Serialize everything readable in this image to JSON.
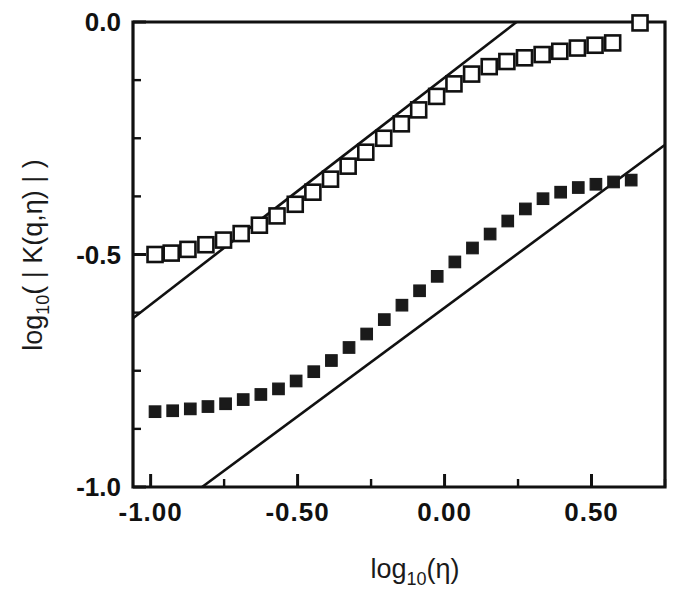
{
  "chart_data": {
    "type": "scatter",
    "title": "",
    "subtitle": "",
    "xlabel": "log10(η)",
    "ylabel": "log10( | K(q,η) | )",
    "xlabel_parts": {
      "base": "log",
      "sub": "10",
      "arg": "(η)"
    },
    "ylabel_parts": {
      "base": "log",
      "sub": "10",
      "arg": "( | K(q,η) | )"
    },
    "xlim": [
      -1.06,
      0.75
    ],
    "ylim": [
      -1.0,
      0.0
    ],
    "grid": false,
    "legend": "none",
    "xticks": [
      -1.0,
      -0.5,
      0.0,
      0.5
    ],
    "xtick_labels": [
      "-1.00",
      "-0.50",
      "0.00",
      "0.50"
    ],
    "xminor_ticks": [
      -0.75,
      -0.25,
      0.25,
      0.5,
      0.75
    ],
    "yticks": [
      0.0,
      -0.5,
      -1.0
    ],
    "ytick_labels": [
      "0.0",
      "-0.5",
      "-1.0"
    ],
    "yminor_ticks": [
      -0.125,
      -0.25,
      -0.375,
      -0.625,
      -0.75,
      -0.875
    ],
    "marker_colors": {
      "open": "#ffffff",
      "filled": "#1a1a1a",
      "edge": "#111111"
    },
    "series": [
      {
        "name": "open-squares",
        "marker": "open-square",
        "points": [
          [
            -0.985,
            -0.5
          ],
          [
            -0.93,
            -0.497
          ],
          [
            -0.873,
            -0.489
          ],
          [
            -0.812,
            -0.479
          ],
          [
            -0.752,
            -0.469
          ],
          [
            -0.692,
            -0.455
          ],
          [
            -0.63,
            -0.437
          ],
          [
            -0.57,
            -0.417
          ],
          [
            -0.508,
            -0.392
          ],
          [
            -0.448,
            -0.366
          ],
          [
            -0.388,
            -0.338
          ],
          [
            -0.328,
            -0.31
          ],
          [
            -0.268,
            -0.28
          ],
          [
            -0.207,
            -0.25
          ],
          [
            -0.147,
            -0.219
          ],
          [
            -0.088,
            -0.189
          ],
          [
            -0.027,
            -0.16
          ],
          [
            0.032,
            -0.133
          ],
          [
            0.092,
            -0.112
          ],
          [
            0.152,
            -0.096
          ],
          [
            0.212,
            -0.085
          ],
          [
            0.272,
            -0.077
          ],
          [
            0.332,
            -0.07
          ],
          [
            0.392,
            -0.063
          ],
          [
            0.452,
            -0.056
          ],
          [
            0.512,
            -0.05
          ],
          [
            0.572,
            -0.045
          ],
          [
            0.665,
            -0.002
          ]
        ]
      },
      {
        "name": "filled-squares",
        "marker": "filled-square",
        "points": [
          [
            -0.985,
            -0.838
          ],
          [
            -0.925,
            -0.836
          ],
          [
            -0.865,
            -0.832
          ],
          [
            -0.805,
            -0.827
          ],
          [
            -0.745,
            -0.821
          ],
          [
            -0.685,
            -0.812
          ],
          [
            -0.625,
            -0.801
          ],
          [
            -0.565,
            -0.789
          ],
          [
            -0.505,
            -0.772
          ],
          [
            -0.445,
            -0.752
          ],
          [
            -0.385,
            -0.728
          ],
          [
            -0.325,
            -0.7
          ],
          [
            -0.265,
            -0.671
          ],
          [
            -0.205,
            -0.64
          ],
          [
            -0.145,
            -0.609
          ],
          [
            -0.085,
            -0.578
          ],
          [
            -0.025,
            -0.547
          ],
          [
            0.035,
            -0.516
          ],
          [
            0.095,
            -0.486
          ],
          [
            0.155,
            -0.456
          ],
          [
            0.215,
            -0.428
          ],
          [
            0.275,
            -0.402
          ],
          [
            0.335,
            -0.38
          ],
          [
            0.395,
            -0.366
          ],
          [
            0.455,
            -0.356
          ],
          [
            0.515,
            -0.349
          ],
          [
            0.575,
            -0.344
          ],
          [
            0.635,
            -0.34
          ]
        ]
      }
    ],
    "fit_lines": [
      {
        "name": "upper-fit-line",
        "x0": -1.06,
        "y0": -0.637,
        "x1": 0.245,
        "y1": 0.0
      },
      {
        "name": "lower-fit-line",
        "x0": -0.825,
        "y0": -1.0,
        "x1": 0.748,
        "y1": -0.265
      }
    ]
  }
}
